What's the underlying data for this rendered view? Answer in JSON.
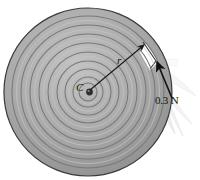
{
  "figure": {
    "background_color": "#ffffff",
    "width": 200,
    "height": 180
  },
  "disk": {
    "name": "spiral-coil-disk",
    "center_x": 88,
    "center_y": 92,
    "outer_radius_x": 84,
    "outer_radius_y": 84,
    "fill_color": "#ababab",
    "edge_color": "#3a3a3a",
    "ring_color": "#787878",
    "ring_count": 9,
    "ring_spacing": 9.2,
    "hub_color": "#2e2e2e",
    "hub_radius": 3.4
  },
  "labels": {
    "center": "C",
    "radius": "r",
    "force": "0.3 N"
  },
  "arrows": {
    "radius_arrow": {
      "name": "radius-arrow",
      "from_x": 90,
      "from_y": 90,
      "to_x": 144,
      "to_y": 45,
      "color": "#1a1a1a"
    },
    "force_arrow": {
      "name": "force-arrow",
      "from_x": 172,
      "from_y": 98,
      "to_x": 157,
      "to_y": 62,
      "color": "#111111",
      "magnitude": "0.3 N"
    }
  },
  "streamer": {
    "name": "frayed-tape-streamer",
    "fill_color": "#e8e8e8",
    "stroke_color": "#c9c9c9",
    "strand_count": 7
  },
  "colors": {
    "disk_fill": "#ababab",
    "disk_edge": "#3a3a3a",
    "ring_line": "#787878",
    "ink": "#101010",
    "paper": "#ffffff"
  }
}
